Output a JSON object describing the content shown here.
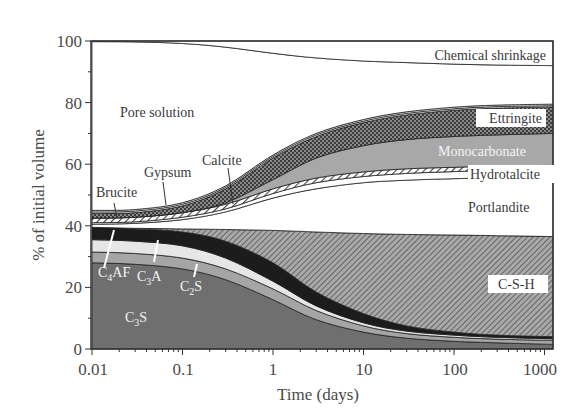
{
  "chart_data": {
    "type": "area",
    "stacked": true,
    "title": "",
    "xlabel": "Time (days)",
    "ylabel": "% of initial volume",
    "xscale": "log",
    "xlim": [
      0.01,
      1300
    ],
    "ylim": [
      0,
      100
    ],
    "x_ticks": [
      0.01,
      0.1,
      1,
      10,
      100,
      1000
    ],
    "x_tick_labels": [
      "0.01",
      "0.1",
      "1",
      "10",
      "100",
      "1000"
    ],
    "y_ticks": [
      0,
      20,
      40,
      60,
      80,
      100
    ],
    "y_tick_labels": [
      "0",
      "20",
      "40",
      "60",
      "80",
      "100"
    ],
    "grid": false,
    "legend": "none (phases labeled inline)",
    "x": [
      0.01,
      0.03,
      0.1,
      0.3,
      1,
      3,
      10,
      30,
      100,
      300,
      1300
    ],
    "boundaries_note": "Cumulative upper boundary of each phase (stacked from bottom), % of initial volume",
    "series": [
      {
        "name": "C3S",
        "fill": "#6f6f6f",
        "pattern": "solid dark gray",
        "upper": [
          28,
          27.5,
          26,
          22.5,
          16,
          9.5,
          5.5,
          3.5,
          2.5,
          2,
          1.5
        ]
      },
      {
        "name": "C2S",
        "fill": "#a5a5a5",
        "pattern": "solid mid gray",
        "upper": [
          31.5,
          31,
          29.5,
          26,
          19.5,
          12.5,
          7.5,
          5,
          3.8,
          3.2,
          2.8
        ]
      },
      {
        "name": "C3A",
        "fill": "#e6e6e6",
        "pattern": "solid light gray",
        "upper": [
          35.5,
          35,
          33.5,
          29.5,
          22,
          14,
          8.5,
          5.8,
          4.5,
          3.8,
          3.3
        ]
      },
      {
        "name": "C4AF",
        "fill": "#1c1c1c",
        "pattern": "solid black",
        "upper": [
          39.5,
          39,
          38,
          35,
          28,
          18.5,
          11.5,
          7.5,
          5.5,
          4.5,
          4
        ]
      },
      {
        "name": "C-S-H",
        "fill": "#8c8c8c",
        "pattern": "diagonal hatch",
        "upper": [
          39.5,
          39.2,
          39,
          38.8,
          38.5,
          38,
          37.5,
          37.2,
          37,
          36.8,
          36.5
        ]
      },
      {
        "name": "Portlandite",
        "fill": "#ffffff",
        "pattern": "white",
        "upper": [
          40.5,
          40.8,
          42,
          44.5,
          49,
          52,
          54,
          54.8,
          55.3,
          55.6,
          56
        ]
      },
      {
        "name": "Hydrotalcite",
        "fill": "#ffffff",
        "pattern": "white band",
        "upper": [
          41,
          41.3,
          42.8,
          45.5,
          50.5,
          54,
          56,
          57,
          57.6,
          58,
          58.3
        ]
      },
      {
        "name": "Calcite",
        "fill": "#9a9a9a",
        "pattern": "diagonal hatch light",
        "upper": [
          42.5,
          42.8,
          44.3,
          47,
          52,
          55.5,
          57.5,
          58.5,
          59,
          59.4,
          59.6
        ]
      },
      {
        "name": "Monocarbonate",
        "fill": "#a8a8a8",
        "pattern": "solid gray",
        "upper": [
          42.5,
          42.8,
          44.3,
          47.5,
          55,
          62,
          66,
          68,
          69,
          69.5,
          70
        ]
      },
      {
        "name": "Ettringite",
        "fill": "#6a6a6a",
        "pattern": "cross-hatch checker",
        "upper": [
          44,
          44.3,
          46.5,
          52,
          62,
          69,
          73.5,
          76,
          77.5,
          78.2,
          78.6
        ]
      },
      {
        "name": "Brucite",
        "fill": "#ffffff",
        "pattern": "white thin band",
        "upper": [
          44.5,
          44.8,
          47,
          52.5,
          62.5,
          69.5,
          74,
          76.5,
          78,
          78.7,
          79
        ]
      },
      {
        "name": "Gypsum",
        "fill": "#ffffff",
        "pattern": "white thin band",
        "upper": [
          45,
          45.3,
          47.5,
          53,
          63,
          70,
          74.5,
          77,
          78.5,
          79.2,
          79.5
        ]
      },
      {
        "name": "Pore solution",
        "fill": "#ffffff",
        "pattern": "white",
        "upper": [
          99.8,
          99.7,
          99.2,
          98,
          96,
          94.5,
          93.5,
          93,
          92.5,
          92.2,
          92
        ]
      },
      {
        "name": "Chemical shrinkage",
        "fill": "#ffffff",
        "pattern": "white",
        "upper": [
          100,
          100,
          100,
          100,
          100,
          100,
          100,
          100,
          100,
          100,
          100
        ]
      }
    ],
    "annotations": [
      {
        "text": "Chemical shrinkage",
        "x": 100,
        "y": 96
      },
      {
        "text": "Pore solution",
        "x": 0.03,
        "y": 77
      },
      {
        "text": "Ettringite",
        "x": 500,
        "y": 75
      },
      {
        "text": "Monocarbonate",
        "x": 300,
        "y": 64
      },
      {
        "text": "Hydrotalcite",
        "x": 300,
        "y": 57
      },
      {
        "text": "Portlandite",
        "x": 300,
        "y": 50
      },
      {
        "text": "Calcite",
        "x": 0.2,
        "y": 62
      },
      {
        "text": "Gypsum",
        "x": 0.06,
        "y": 59
      },
      {
        "text": "Brucite",
        "x": 0.015,
        "y": 53
      },
      {
        "text": "C-S-H",
        "x": 600,
        "y": 22
      },
      {
        "text": "C4AF",
        "x": 0.012,
        "y": 33
      },
      {
        "text": "C3A",
        "x": 0.05,
        "y": 33
      },
      {
        "text": "C2S",
        "x": 0.15,
        "y": 21
      },
      {
        "text": "C3S",
        "x": 0.04,
        "y": 10
      }
    ]
  },
  "labels": {
    "xlabel": "Time (days)",
    "ylabel": "% of initial volume",
    "chemical_shrinkage": "Chemical shrinkage",
    "pore_solution": "Pore solution",
    "ettringite": "Ettringite",
    "monocarbonate": "Monocarbonate",
    "hydrotalcite": "Hydrotalcite",
    "portlandite": "Portlandite",
    "calcite": "Calcite",
    "gypsum": "Gypsum",
    "brucite": "Brucite",
    "csh": "C-S-H",
    "c4af_main": "C",
    "c4af_sub": "4",
    "c4af_tail": "AF",
    "c3a_main": "C",
    "c3a_sub": "3",
    "c3a_tail": "A",
    "c2s_main": "C",
    "c2s_sub": "2",
    "c2s_tail": "S",
    "c3s_main": "C",
    "c3s_sub": "3",
    "c3s_tail": "S"
  }
}
